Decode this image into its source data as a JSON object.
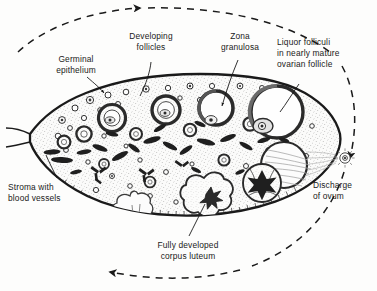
{
  "figure": {
    "background_color": "#fdfdfc",
    "ink_color": "#1a1a1a",
    "stroma_fill": "#fbfbfa"
  },
  "labels": {
    "germinal_epithelium": {
      "lines": [
        "Germinal",
        "epithelium"
      ],
      "name": "germinal-epithelium"
    },
    "developing_follicles": {
      "lines": [
        "Developing",
        "follicles"
      ],
      "name": "developing-follicles"
    },
    "zona_granulosa": {
      "lines": [
        "Zona",
        "granulosa"
      ],
      "name": "zona-granulosa"
    },
    "liquor_folliculi": {
      "lines": [
        "Liquor folliculi",
        "in nearly mature",
        "ovarian follicle"
      ],
      "name": "liquor-folliculi"
    },
    "stroma": {
      "lines": [
        "Stroma with",
        "blood vessels"
      ],
      "name": "stroma-with-blood-vessels"
    },
    "corpus_luteum": {
      "lines": [
        "Fully developed",
        "corpus luteum"
      ],
      "name": "fully-developed-corpus-luteum"
    },
    "discharge_of_ovum": {
      "lines": [
        "Discharge",
        "of ovum"
      ],
      "name": "discharge-of-ovum"
    }
  },
  "cycle": {
    "direction": "clockwise",
    "arrow_count": 3,
    "style": "dashed"
  },
  "structures": {
    "developing_follicle_count": 7,
    "mature_follicle_count": 1,
    "ruptured_follicle_count": 1,
    "corpus_luteum_count": 2,
    "discharged_ovum_count": 1
  }
}
